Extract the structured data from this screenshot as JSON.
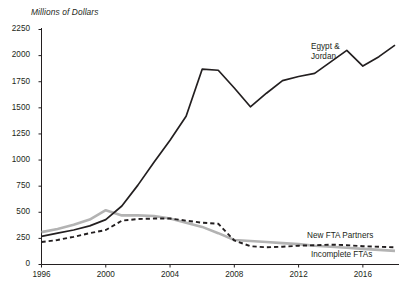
{
  "chart_data": {
    "type": "line",
    "title": "Millions of Dollars",
    "xlabel": "",
    "ylabel": "Millions of Dollars",
    "xlim": [
      1996,
      2018
    ],
    "ylim": [
      0,
      2250
    ],
    "ytick_step": 250,
    "grid": false,
    "legend_position": "inline-right",
    "x": [
      1996,
      1997,
      1998,
      1999,
      2000,
      2001,
      2002,
      2003,
      2004,
      2005,
      2006,
      2007,
      2008,
      2009,
      2010,
      2011,
      2012,
      2013,
      2014,
      2015,
      2016,
      2017,
      2018
    ],
    "yticks": [
      "0",
      "250",
      "500",
      "750",
      "1000",
      "1250",
      "1500",
      "1750",
      "2000",
      "2250"
    ],
    "xticks": [
      "1996",
      "2000",
      "2004",
      "2008",
      "2012",
      "2016"
    ],
    "series": [
      {
        "name": "Egypt & Jordan",
        "style": "solid",
        "color": "#231f20",
        "label_lines": "Egypt &\nJordan",
        "values": [
          270,
          300,
          330,
          370,
          430,
          560,
          760,
          980,
          1190,
          1420,
          1870,
          1860,
          1690,
          1510,
          1640,
          1760,
          1800,
          1830,
          1940,
          2050,
          1900,
          1990,
          2100
        ]
      },
      {
        "name": "Incomplete FTAs",
        "style": "solid",
        "color": "#b3b3b3",
        "label_lines": "Incomplete FTAs",
        "values": [
          310,
          340,
          380,
          430,
          520,
          470,
          470,
          465,
          440,
          400,
          360,
          300,
          235,
          225,
          215,
          205,
          195,
          180,
          170,
          160,
          150,
          140,
          130
        ]
      },
      {
        "name": "New FTA Partners",
        "style": "dashed",
        "color": "#231f20",
        "label_lines": "New FTA Partners",
        "values": [
          215,
          235,
          265,
          300,
          330,
          420,
          435,
          440,
          440,
          420,
          400,
          390,
          230,
          175,
          165,
          170,
          180,
          185,
          190,
          185,
          175,
          170,
          165
        ]
      }
    ]
  },
  "labels": {
    "egypt_jordan": "Egypt &\nJordan",
    "new_fta_partners": "New FTA Partners",
    "incomplete_ftas": "Incomplete FTAs"
  }
}
